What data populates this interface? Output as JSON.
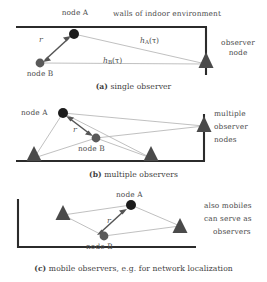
{
  "figure": {
    "panels": [
      {
        "id": "a",
        "caption_tag": "(a)",
        "caption_text": "single observer",
        "labels": {
          "node_a": "node A",
          "node_b": "node B",
          "walls": "walls of indoor environment",
          "observer": "observer\nnode",
          "observer_line1": "observer",
          "observer_line2": "node",
          "distance": "r",
          "channel_a_h": "h",
          "channel_a_sub": "A",
          "channel_a_arg": "(τ)",
          "channel_b_h": "h",
          "channel_b_sub": "B",
          "channel_b_arg": "(τ)"
        }
      },
      {
        "id": "b",
        "caption_tag": "(b)",
        "caption_text": "multiple observers",
        "labels": {
          "node_a": "node A",
          "node_b": "node B",
          "distance": "r",
          "observers_line1": "multiple",
          "observers_line2": "observer",
          "observers_line3": "nodes"
        }
      },
      {
        "id": "c",
        "caption_tag": "(c)",
        "caption_text": "mobile observers, e.g. for network localization",
        "labels": {
          "node_a": "node A",
          "node_b": "node B",
          "distance": "r",
          "note_line1": "also mobiles",
          "note_line2": "can serve as",
          "note_line3": "observers"
        }
      }
    ],
    "colors": {
      "wall": "#2b2b2b",
      "node_a_fill": "#1c1c1c",
      "node_b_fill": "#5a5a5a",
      "observer_fill": "#4a4a4a",
      "link_line": "#a8a8a8",
      "arrow": "#555555",
      "text": "#3f3f3f",
      "background": "#ffffff"
    }
  }
}
